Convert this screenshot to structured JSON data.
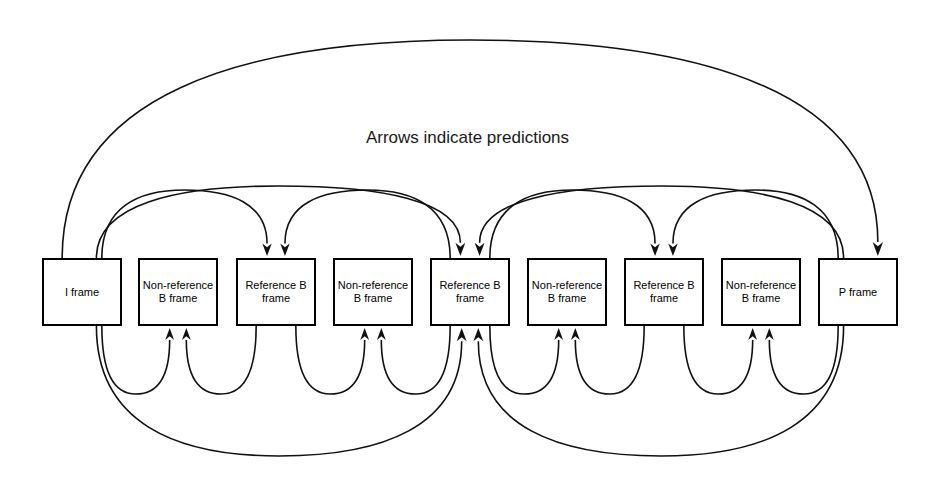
{
  "diagram": {
    "title": "Arrows indicate predictions",
    "caption_y": 128,
    "background_color": "#ffffff",
    "line_color": "#111111",
    "box_border_color": "#000000",
    "box_fill_color": "#ffffff",
    "width": 935,
    "height": 484
  },
  "frames": [
    {
      "id": "frame-0",
      "label": "I frame",
      "type": "I",
      "x": 42,
      "y": 258,
      "w": 80,
      "h": 68
    },
    {
      "id": "frame-1",
      "label": "Non-reference\nB frame",
      "type": "non-ref-B",
      "x": 138,
      "y": 258,
      "w": 80,
      "h": 68
    },
    {
      "id": "frame-2",
      "label": "Reference B\nframe",
      "type": "ref-B",
      "x": 236,
      "y": 258,
      "w": 80,
      "h": 68
    },
    {
      "id": "frame-3",
      "label": "Non-reference\nB frame",
      "type": "non-ref-B",
      "x": 333,
      "y": 258,
      "w": 80,
      "h": 68
    },
    {
      "id": "frame-4",
      "label": "Reference B\nframe",
      "type": "ref-B",
      "x": 430,
      "y": 258,
      "w": 80,
      "h": 68
    },
    {
      "id": "frame-5",
      "label": "Non-reference\nB frame",
      "type": "non-ref-B",
      "x": 527,
      "y": 258,
      "w": 80,
      "h": 68
    },
    {
      "id": "frame-6",
      "label": "Reference B\nframe",
      "type": "ref-B",
      "x": 624,
      "y": 258,
      "w": 80,
      "h": 68
    },
    {
      "id": "frame-7",
      "label": "Non-reference\nB frame",
      "type": "non-ref-B",
      "x": 721,
      "y": 258,
      "w": 80,
      "h": 68
    },
    {
      "id": "frame-8",
      "label": "P frame",
      "type": "P",
      "x": 818,
      "y": 258,
      "w": 80,
      "h": 68
    }
  ],
  "legend": {
    "note": "Arrows indicate predictions"
  },
  "predictions": [
    {
      "from": "frame-0",
      "to": "frame-8",
      "side": "top",
      "span": "outer"
    },
    {
      "from": "frame-0",
      "to": "frame-4",
      "side": "top",
      "span": "major"
    },
    {
      "from": "frame-8",
      "to": "frame-4",
      "side": "top",
      "span": "major"
    },
    {
      "from": "frame-0",
      "to": "frame-2",
      "side": "top",
      "span": "minor"
    },
    {
      "from": "frame-4",
      "to": "frame-2",
      "side": "top",
      "span": "minor"
    },
    {
      "from": "frame-4",
      "to": "frame-6",
      "side": "top",
      "span": "minor"
    },
    {
      "from": "frame-8",
      "to": "frame-6",
      "side": "top",
      "span": "minor"
    },
    {
      "from": "frame-0",
      "to": "frame-4",
      "side": "bottom",
      "span": "major"
    },
    {
      "from": "frame-8",
      "to": "frame-4",
      "side": "bottom",
      "span": "major"
    },
    {
      "from": "frame-0",
      "to": "frame-1",
      "side": "bottom",
      "span": "small"
    },
    {
      "from": "frame-2",
      "to": "frame-1",
      "side": "bottom",
      "span": "small"
    },
    {
      "from": "frame-2",
      "to": "frame-3",
      "side": "bottom",
      "span": "small"
    },
    {
      "from": "frame-4",
      "to": "frame-3",
      "side": "bottom",
      "span": "small"
    },
    {
      "from": "frame-4",
      "to": "frame-5",
      "side": "bottom",
      "span": "small"
    },
    {
      "from": "frame-6",
      "to": "frame-5",
      "side": "bottom",
      "span": "small"
    },
    {
      "from": "frame-6",
      "to": "frame-7",
      "side": "bottom",
      "span": "small"
    },
    {
      "from": "frame-8",
      "to": "frame-7",
      "side": "bottom",
      "span": "small"
    }
  ]
}
